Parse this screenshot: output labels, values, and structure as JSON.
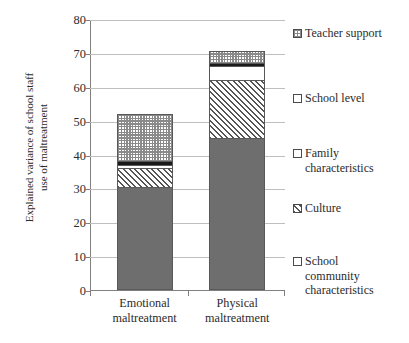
{
  "chart_data": {
    "type": "bar",
    "subtype": "stacked-bar",
    "title": "",
    "xlabel": "",
    "ylabel": "Explained variance of school staff use of maltreatment",
    "ylim": [
      0,
      80
    ],
    "yticks": [
      0,
      10,
      20,
      30,
      40,
      50,
      60,
      70,
      80
    ],
    "grid": true,
    "legend_position": "right",
    "categories": [
      "Emotional maltreatment",
      "Physical maltreatment"
    ],
    "series": [
      {
        "name": "School community characteristics",
        "values": [
          30.5,
          45.0
        ],
        "fill": "solid-gray",
        "color": "#6e6e6e"
      },
      {
        "name": "Culture",
        "values": [
          5.5,
          17.0
        ],
        "fill": "diagonal",
        "color": "#555555"
      },
      {
        "name": "Family characteristics",
        "values": [
          1.0,
          4.0
        ],
        "fill": "white",
        "color": "#ffffff"
      },
      {
        "name": "School level",
        "values": [
          1.0,
          1.0
        ],
        "fill": "solid-black",
        "color": "#1a1a1a"
      },
      {
        "name": "Teacher support",
        "values": [
          14.0,
          3.5
        ],
        "fill": "checker",
        "color": "#8a8a8a"
      }
    ],
    "totals": [
      52.0,
      70.5
    ]
  },
  "axis": {
    "y_title_line1": "Explained variance of school staff",
    "y_title_line2": "use of maltreatment",
    "tick_labels": [
      "80",
      "70",
      "60",
      "50",
      "40",
      "30",
      "20",
      "10",
      "0"
    ]
  },
  "categories": [
    {
      "line1": "Emotional",
      "line2": "maltreatment"
    },
    {
      "line1": "Physical",
      "line2": "maltreatment"
    }
  ],
  "legend": {
    "items": [
      {
        "label": "Teacher support"
      },
      {
        "label": "School level"
      },
      {
        "label": "Family\ncharacteristics"
      },
      {
        "label": "Culture"
      },
      {
        "label": "School\ncommunity\ncharacteristics"
      }
    ]
  }
}
